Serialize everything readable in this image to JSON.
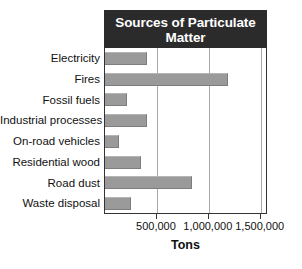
{
  "chart_data": {
    "type": "bar",
    "orientation": "horizontal",
    "title": "Sources of Particulate Matter",
    "title_lines": [
      "Sources of Particulate",
      "Matter"
    ],
    "xlabel": "Tons",
    "ylabel": "",
    "categories": [
      "Electricity",
      "Fires",
      "Fossil fuels",
      "Industrial processes",
      "On-road vehicles",
      "Residential wood",
      "Road dust",
      "Waste disposal"
    ],
    "values": [
      405000,
      1185000,
      210000,
      405000,
      135000,
      345000,
      840000,
      250000
    ],
    "xlim": [
      0,
      1570000
    ],
    "xticks": [
      500000,
      1000000,
      1500000
    ],
    "xticklabels": [
      "500,000",
      "1,000,000",
      "1,500,000"
    ],
    "grid": true,
    "grid_axis": "x",
    "legend": false,
    "colors": {
      "bar_fill": "#9a9a9a",
      "bar_edge": "#7d7d7d",
      "title_bar_bg": "#2b2b2b",
      "title_text": "#ffffff",
      "axis_line": "#333333",
      "gridline": "#a8a8a8",
      "label_text": "#111111",
      "background": "#ffffff"
    }
  }
}
